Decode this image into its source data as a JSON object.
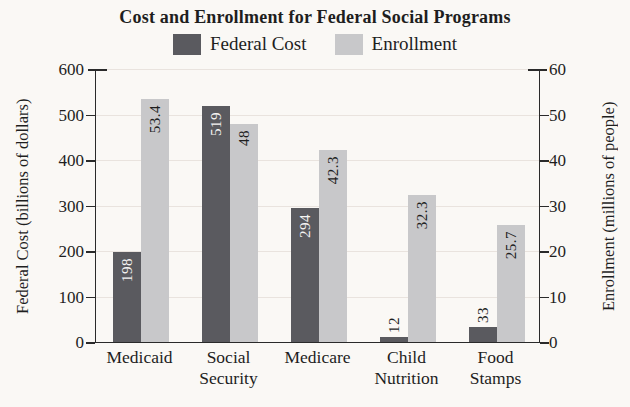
{
  "title": "Cost and Enrollment for Federal Social Programs",
  "legend": {
    "items": [
      {
        "label": "Federal Cost",
        "color": "#5a5a5f"
      },
      {
        "label": "Enrollment",
        "color": "#c8c8ca"
      }
    ]
  },
  "colors": {
    "background": "#faf8f5",
    "axis": "#2a2a2a",
    "grid": "#e9e3de",
    "text": "#1e1e1e",
    "bar_label_on_dark": "#f5f4f2",
    "bar_label_on_light": "#1e1e1e"
  },
  "chart_data": {
    "type": "bar",
    "title": "Cost and Enrollment for Federal Social Programs",
    "categories": [
      "Medicaid",
      "Social Security",
      "Medicare",
      "Child Nutrition",
      "Food Stamps"
    ],
    "series": [
      {
        "name": "Federal Cost",
        "axis": "left",
        "color": "#5a5a5f",
        "values": [
          198,
          519,
          294,
          12,
          33
        ],
        "labels": [
          "198",
          "519",
          "294",
          "12",
          "33"
        ]
      },
      {
        "name": "Enrollment",
        "axis": "right",
        "color": "#c8c8ca",
        "values": [
          53.4,
          48,
          42.3,
          32.3,
          25.7
        ],
        "labels": [
          "53.4",
          "48",
          "42.3",
          "32.3",
          "25.7"
        ]
      }
    ],
    "left_axis": {
      "label": "Federal Cost (billions of dollars)",
      "ticks": [
        0,
        100,
        200,
        300,
        400,
        500,
        600
      ],
      "min": 0,
      "max": 600
    },
    "right_axis": {
      "label": "Enrollment (millions of people)",
      "ticks": [
        0,
        10,
        20,
        30,
        40,
        50,
        60
      ],
      "min": 0,
      "max": 60
    },
    "grid": true,
    "legend_position": "top",
    "value_labels": "rotated-90-at-bar-top"
  }
}
